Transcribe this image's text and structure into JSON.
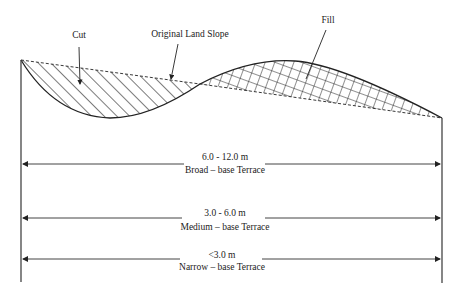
{
  "labels": {
    "cut": "Cut",
    "original_land_slope": "Original Land Slope",
    "fill": "Fill"
  },
  "terraces": [
    {
      "width": "6.0 - 12.0 m",
      "name": "Broad – base Terrace"
    },
    {
      "width": "3.0 - 6.0 m",
      "name": "Medium – base Terrace"
    },
    {
      "width": "<3.0 m",
      "name": "Narrow – base Terrace"
    }
  ],
  "colors": {
    "line": "#222222",
    "background": "#ffffff"
  }
}
